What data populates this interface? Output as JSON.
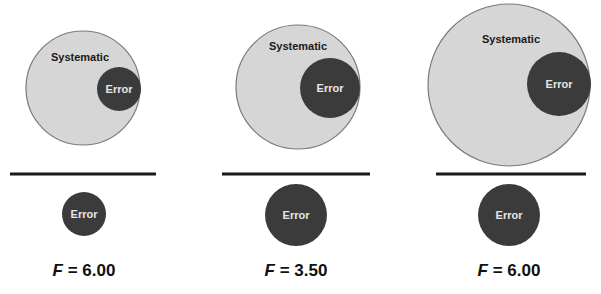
{
  "colors": {
    "systematic_fill": "#d6d6d6",
    "systematic_stroke": "#7a7a7a",
    "error_fill": "#3b3b3b",
    "error_text": "#e6e6e6",
    "divider": "#1a1a1a",
    "text": "#111111"
  },
  "panels": [
    {
      "numerator": {
        "systematic_label": "Systematic",
        "error_label": "Error",
        "systematic_circle": {
          "cx": 83,
          "cy": 88,
          "r": 57
        },
        "error_circle": {
          "cx": 119,
          "cy": 89,
          "r": 22
        }
      },
      "divider": {
        "x1": 10,
        "x2": 156,
        "y": 174
      },
      "denominator": {
        "error_label": "Error",
        "error_circle": {
          "cx": 84,
          "cy": 214,
          "r": 22
        }
      },
      "f_label": {
        "var": "F",
        "equals": " = ",
        "value": "6.00"
      }
    },
    {
      "numerator": {
        "systematic_label": "Systematic",
        "error_label": "Error",
        "systematic_circle": {
          "cx": 298,
          "cy": 87,
          "r": 62
        },
        "error_circle": {
          "cx": 330,
          "cy": 88,
          "r": 30
        }
      },
      "divider": {
        "x1": 222,
        "x2": 370,
        "y": 174
      },
      "denominator": {
        "error_label": "Error",
        "error_circle": {
          "cx": 296,
          "cy": 215,
          "r": 31
        }
      },
      "f_label": {
        "var": "F",
        "equals": " = ",
        "value": "3.50"
      }
    },
    {
      "numerator": {
        "systematic_label": "Systematic",
        "error_label": "Error",
        "systematic_circle": {
          "cx": 509,
          "cy": 85,
          "r": 81
        },
        "error_circle": {
          "cx": 559,
          "cy": 84,
          "r": 32
        }
      },
      "divider": {
        "x1": 436,
        "x2": 586,
        "y": 174
      },
      "denominator": {
        "error_label": "Error",
        "error_circle": {
          "cx": 509,
          "cy": 215,
          "r": 31
        }
      },
      "f_label": {
        "var": "F",
        "equals": " = ",
        "value": "6.00"
      }
    }
  ]
}
